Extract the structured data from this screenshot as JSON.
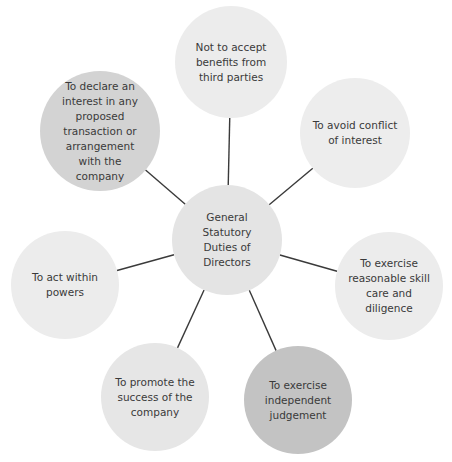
{
  "diagram": {
    "center": {
      "label": "General\nStatutory\nDuties of\nDirectors",
      "cx": 227,
      "cy": 240,
      "r": 55,
      "color": "#e4e4e4"
    },
    "duties": [
      {
        "label": "Not to accept\nbenefits from\nthird parties",
        "cx": 231,
        "cy": 62,
        "r": 56,
        "color": "#ececec"
      },
      {
        "label": "To avoid conflict\nof interest",
        "cx": 355,
        "cy": 133,
        "r": 55,
        "color": "#ededed"
      },
      {
        "label": "To exercise\nreasonable skill\ncare and diligence",
        "cx": 389,
        "cy": 286,
        "r": 54,
        "color": "#ececec"
      },
      {
        "label": "To exercise\nindependent\njudgement",
        "cx": 298,
        "cy": 400,
        "r": 54,
        "color": "#c3c3c3"
      },
      {
        "label": "To promote the\nsuccess of the\ncompany",
        "cx": 155,
        "cy": 397,
        "r": 54,
        "color": "#e6e6e6"
      },
      {
        "label": "To act within\npowers",
        "cx": 65,
        "cy": 285,
        "r": 54,
        "color": "#ececec"
      },
      {
        "label": "To declare an\ninterest in any\nproposed\ntransaction or\narrangement\nwith the\ncompany",
        "cx": 100,
        "cy": 131,
        "r": 60,
        "color": "#d3d3d3"
      }
    ],
    "connector_color": "#3a3a3a"
  }
}
